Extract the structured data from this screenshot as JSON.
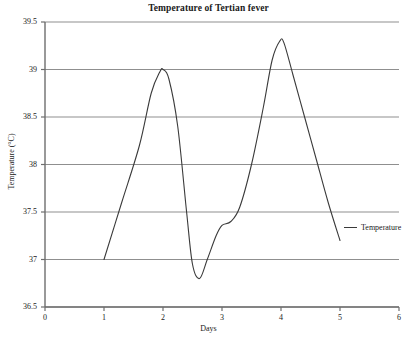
{
  "chart_data": {
    "type": "line",
    "title": "Temperature of Tertian fever",
    "xlabel": "Days",
    "ylabel": "Temperature (°C)",
    "xlim": [
      0,
      6
    ],
    "ylim": [
      36.5,
      39.5
    ],
    "xticks": [
      "0",
      "1",
      "2",
      "3",
      "4",
      "5",
      "6"
    ],
    "yticks": [
      "36.5",
      "37",
      "37.5",
      "38",
      "38.5",
      "39",
      "39.5"
    ],
    "grid": "horizontal",
    "legend_position": "right",
    "series": [
      {
        "name": "Temperature",
        "color": "#3a3a3a",
        "x": [
          1.0,
          1.3,
          1.6,
          1.8,
          1.95,
          2.0,
          2.1,
          2.25,
          2.4,
          2.5,
          2.62,
          2.75,
          2.9,
          3.0,
          3.15,
          3.3,
          3.5,
          3.7,
          3.85,
          3.98,
          4.05,
          4.2,
          4.4,
          4.6,
          4.8,
          5.0
        ],
        "y": [
          37.0,
          37.6,
          38.2,
          38.75,
          38.98,
          39.0,
          38.9,
          38.4,
          37.5,
          36.95,
          36.8,
          37.0,
          37.25,
          37.36,
          37.4,
          37.55,
          38.0,
          38.6,
          39.1,
          39.3,
          39.28,
          38.95,
          38.5,
          38.05,
          37.6,
          37.2
        ]
      }
    ],
    "legend": [
      {
        "label": "Temperature",
        "color": "#3a3a3a"
      }
    ]
  },
  "axes_geometry": {
    "plot_left": 45,
    "plot_right": 399,
    "plot_top": 22,
    "plot_bottom": 307
  }
}
